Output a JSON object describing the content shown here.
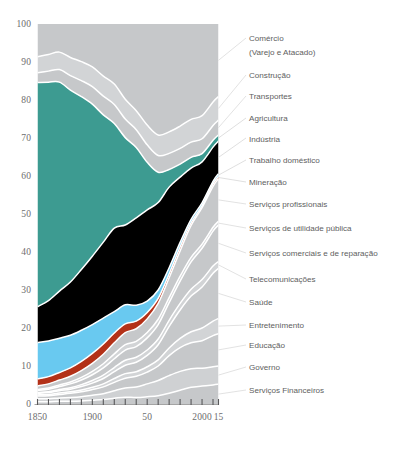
{
  "chart_data": {
    "type": "area",
    "title": "",
    "subtitle": "",
    "xlabel": "",
    "ylabel": "",
    "stacked": true,
    "percent": true,
    "grid": false,
    "legend_position": "right",
    "xlim": [
      1850,
      2015
    ],
    "ylim": [
      0,
      100
    ],
    "x": [
      1850,
      1860,
      1870,
      1880,
      1890,
      1900,
      1910,
      1920,
      1930,
      1940,
      1950,
      1960,
      1970,
      1980,
      1990,
      2000,
      2010,
      2015
    ],
    "ytick_labels": [
      "0",
      "10",
      "20",
      "30",
      "40",
      "50",
      "60",
      "70",
      "80",
      "90",
      "100"
    ],
    "yticks": [
      0,
      10,
      20,
      30,
      40,
      50,
      60,
      70,
      80,
      90,
      100
    ],
    "xtick_labels": [
      "1850",
      "1900",
      "50",
      "2000",
      "15"
    ],
    "xticks": [
      1850,
      1900,
      1950,
      2000,
      2015
    ],
    "minor_xticks": [
      1850,
      1860,
      1870,
      1880,
      1890,
      1900,
      1910,
      1920,
      1930,
      1940,
      1950,
      1960,
      1970,
      1980,
      1990,
      2000,
      2010,
      2015
    ],
    "colors": {
      "gray": "#c6c8ca",
      "gray_light": "#d2d4d6",
      "teal": "#3d9b91",
      "indigo": "#47479e2",
      "lightblue": "#69c9f0",
      "red": "#b33118",
      "separator": "#ffffff",
      "axis_text": "#6d6d6d",
      "label_text": "#5e5e5e",
      "background": "#ffffff"
    },
    "series": [
      {
        "name": "Serviços Financeiros",
        "color": "#c6c8ca",
        "highlight": false,
        "label_y": 390,
        "values": [
          0.6,
          0.6,
          0.7,
          0.7,
          0.8,
          1.0,
          1.2,
          1.5,
          1.8,
          1.7,
          1.9,
          2.2,
          2.8,
          3.6,
          4.4,
          4.8,
          5.0,
          5.2
        ]
      },
      {
        "name": "Governo",
        "color": "#cfd1d3",
        "highlight": false,
        "label_y": 367,
        "values": [
          0.8,
          0.8,
          0.9,
          1.0,
          1.1,
          1.3,
          1.5,
          2.0,
          2.4,
          2.8,
          3.4,
          4.0,
          4.6,
          4.9,
          4.9,
          4.8,
          4.8,
          4.8
        ]
      },
      {
        "name": "Educação",
        "color": "#c6c8ca",
        "highlight": false,
        "label_y": 345,
        "values": [
          0.7,
          0.8,
          0.9,
          1.1,
          1.3,
          1.5,
          1.8,
          2.2,
          2.6,
          2.8,
          3.1,
          3.8,
          5.2,
          6.2,
          6.8,
          7.4,
          8.2,
          8.5
        ]
      },
      {
        "name": "Entretenimento",
        "color": "#d2d4d6",
        "highlight": false,
        "label_y": 325,
        "values": [
          0.3,
          0.3,
          0.4,
          0.4,
          0.5,
          0.6,
          0.8,
          1.0,
          1.2,
          1.2,
          1.4,
          1.6,
          2.0,
          2.4,
          2.9,
          3.4,
          3.8,
          4.0
        ]
      },
      {
        "name": "Saúde",
        "color": "#c6c8ca",
        "highlight": false,
        "label_y": 302,
        "values": [
          0.4,
          0.5,
          0.6,
          0.7,
          0.9,
          1.1,
          1.4,
          1.8,
          2.2,
          2.5,
          3.0,
          4.0,
          5.6,
          7.4,
          9.4,
          11.0,
          12.6,
          13.2
        ]
      },
      {
        "name": "Telecomunicações",
        "color": "#d2d4d6",
        "highlight": false,
        "label_y": 279,
        "values": [
          0.2,
          0.2,
          0.3,
          0.4,
          0.5,
          0.7,
          0.9,
          1.1,
          1.3,
          1.3,
          1.4,
          1.5,
          1.6,
          1.7,
          1.8,
          2.0,
          1.9,
          1.8
        ]
      },
      {
        "name": "Serviços comerciais e de reparação",
        "color": "#c6c8ca",
        "highlight": false,
        "label_y": 253,
        "values": [
          0.6,
          0.7,
          0.8,
          1.0,
          1.2,
          1.5,
          1.9,
          2.3,
          2.7,
          2.8,
          3.2,
          3.8,
          4.6,
          5.8,
          7.2,
          8.4,
          9.2,
          9.6
        ]
      },
      {
        "name": "Serviços de utilidade pública",
        "color": "#d2d4d6",
        "highlight": false,
        "label_y": 228,
        "values": [
          0.2,
          0.3,
          0.4,
          0.5,
          0.7,
          0.9,
          1.1,
          1.3,
          1.4,
          1.4,
          1.4,
          1.4,
          1.3,
          1.3,
          1.2,
          1.1,
          1.0,
          1.0
        ]
      },
      {
        "name": "Serviços profissionais",
        "color": "#c6c8ca",
        "highlight": false,
        "label_y": 204,
        "values": [
          1.0,
          1.1,
          1.3,
          1.5,
          1.8,
          2.1,
          2.5,
          2.9,
          3.2,
          3.3,
          3.6,
          4.2,
          5.2,
          6.6,
          8.4,
          9.8,
          10.8,
          11.2
        ]
      },
      {
        "name": "Mineração",
        "color": "#b33118",
        "highlight": true,
        "label_y": 182,
        "values": [
          1.8,
          1.9,
          2.0,
          2.2,
          2.4,
          2.6,
          2.7,
          2.6,
          2.3,
          2.0,
          1.7,
          1.3,
          1.0,
          1.0,
          0.7,
          0.5,
          0.6,
          0.6
        ]
      },
      {
        "name": "Trabalho doméstico",
        "color": "#69c9f0",
        "highlight": true,
        "label_y": 160,
        "values": [
          9.6,
          9.4,
          9.0,
          8.6,
          8.2,
          7.6,
          6.8,
          5.6,
          5.0,
          4.2,
          3.0,
          2.2,
          1.6,
          1.2,
          0.9,
          0.8,
          0.7,
          0.7
        ]
      },
      {
        "name": "Indústria",
        "color": "#47479e2",
        "highlight": true,
        "label_y": 138,
        "values": [
          9.4,
          10.6,
          12.4,
          14.0,
          16.0,
          18.0,
          20.0,
          22.0,
          21.0,
          23.0,
          24.0,
          23.0,
          21.0,
          17.0,
          13.5,
          11.0,
          9.0,
          8.6
        ]
      },
      {
        "name": "Agricultura",
        "color": "#3d9b91",
        "highlight": true,
        "label_y": 118,
        "values": [
          59.0,
          57.5,
          55.0,
          50.5,
          45.5,
          40.0,
          33.5,
          27.5,
          23.0,
          18.5,
          12.5,
          8.0,
          4.6,
          3.4,
          2.8,
          2.2,
          1.8,
          1.6
        ]
      },
      {
        "name": "Transportes",
        "color": "#c6c8ca",
        "highlight": false,
        "label_y": 96,
        "values": [
          2.6,
          2.9,
          3.3,
          3.8,
          4.2,
          4.6,
          4.9,
          5.0,
          4.9,
          4.7,
          4.6,
          4.4,
          4.2,
          4.1,
          4.0,
          4.0,
          3.9,
          3.9
        ]
      },
      {
        "name": "Construção",
        "color": "#d2d4d6",
        "highlight": false,
        "label_y": 75,
        "values": [
          4.2,
          4.4,
          4.6,
          4.8,
          5.0,
          5.2,
          5.3,
          5.4,
          5.2,
          5.0,
          5.2,
          5.4,
          5.6,
          5.8,
          6.0,
          6.2,
          6.2,
          6.2
        ]
      },
      {
        "name": "Comércio (Varejo e Atacado)",
        "color": "#c6c8ca",
        "highlight": false,
        "label_y": 38,
        "label_line2": "(Varejo e Atacado)",
        "values": [
          8.6,
          8.0,
          7.4,
          8.8,
          9.9,
          11.3,
          13.7,
          15.8,
          19.8,
          22.8,
          26.6,
          29.2,
          28.1,
          26.6,
          25.1,
          24.6,
          20.5,
          19.1
        ]
      }
    ],
    "label_order": [
      "Comércio",
      "(Varejo e Atacado)",
      "Construção",
      "Transportes",
      "Agricultura",
      "Indústria",
      "Trabalho doméstico",
      "Mineração",
      "Serviços profissionais",
      "Serviços de utilidade pública",
      "Serviços comerciais e de reparação",
      "Telecomunicações",
      "Saúde",
      "Entretenimento",
      "Educação",
      "Governo",
      "Serviços Financeiros"
    ]
  },
  "labels": {
    "comercio_l1": "Comércio",
    "comercio_l2": "(Varejo e Atacado)",
    "construcao": "Construção",
    "transportes": "Transportes",
    "agricultura": "Agricultura",
    "industria": "Indústria",
    "trabalho_domestico": "Trabalho doméstico",
    "mineracao": "Mineração",
    "servicos_profissionais": "Serviços profissionais",
    "servicos_utilidade": "Serviços de utilidade pública",
    "servicos_comerciais": "Serviços comerciais e de reparação",
    "telecomunicacoes": "Telecomunicações",
    "saude": "Saúde",
    "entretenimento": "Entretenimento",
    "educacao": "Educação",
    "governo": "Governo",
    "servicos_financeiros": "Serviços Financeiros"
  },
  "axis": {
    "y": [
      "100",
      "90",
      "80",
      "70",
      "60",
      "50",
      "40",
      "30",
      "20",
      "10",
      "0"
    ],
    "x": [
      "1850",
      "1900",
      "50",
      "2000",
      "15"
    ]
  }
}
